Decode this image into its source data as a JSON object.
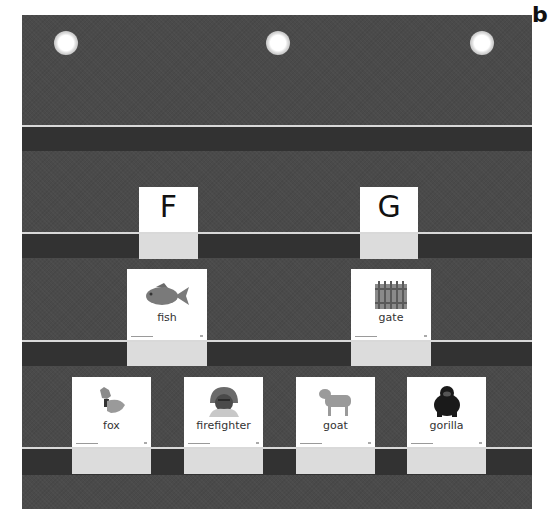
{
  "figure_label": "b",
  "chart": {
    "colors": {
      "fabric": "#4a4a4a",
      "pocket_band": "#323232",
      "pocket_line": "#d9d9d9",
      "card": "#ffffff",
      "card_lower": "#dcdcdc"
    },
    "grommets": [
      {
        "x": 54,
        "y": 31
      },
      {
        "x": 266,
        "y": 31
      },
      {
        "x": 470,
        "y": 31
      }
    ],
    "pockets": [
      {
        "line_y": 125,
        "band_y": 127,
        "band_h": 24
      },
      {
        "line_y": 232,
        "band_y": 234,
        "band_h": 24
      },
      {
        "line_y": 340,
        "band_y": 342,
        "band_h": 24
      },
      {
        "line_y": 447,
        "band_y": 449,
        "band_h": 26
      }
    ]
  },
  "letter_cards": [
    {
      "letter": "F"
    },
    {
      "letter": "G"
    }
  ],
  "picture_cards": [
    {
      "word": "fish",
      "icon": "fish-icon"
    },
    {
      "word": "gate",
      "icon": "gate-icon"
    },
    {
      "word": "fox",
      "icon": "fox-icon"
    },
    {
      "word": "firefighter",
      "icon": "firefighter-icon"
    },
    {
      "word": "goat",
      "icon": "goat-icon"
    },
    {
      "word": "gorilla",
      "icon": "gorilla-icon"
    }
  ]
}
